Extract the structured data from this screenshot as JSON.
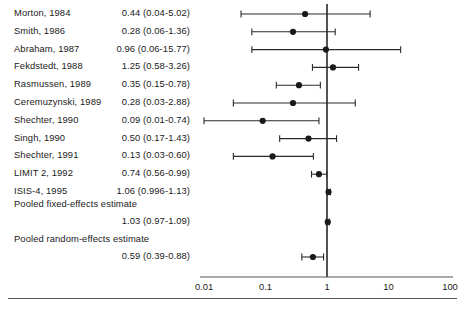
{
  "chart_data": {
    "type": "forest",
    "title": "",
    "xlabel": "",
    "ylabel": "",
    "xscale": "log",
    "xlim": [
      0.01,
      100
    ],
    "xticks": [
      0.01,
      0.1,
      1,
      10,
      100
    ],
    "xtick_labels": [
      "0.01",
      "0.1",
      "1",
      "10",
      "100"
    ],
    "null_line": 1,
    "grid": false,
    "legend": "none",
    "studies": [
      {
        "label": "Morton, 1984",
        "estimate_text": "0.44 (0.04-5.02)",
        "est": 0.44,
        "low": 0.04,
        "high": 5.02
      },
      {
        "label": "Smith, 1986",
        "estimate_text": "0.28 (0.06-1.36)",
        "est": 0.28,
        "low": 0.06,
        "high": 1.36
      },
      {
        "label": "Abraham, 1987",
        "estimate_text": "0.96 (0.06-15.77)",
        "est": 0.96,
        "low": 0.06,
        "high": 15.77
      },
      {
        "label": "Fekdstedt, 1988",
        "estimate_text": "1.25 (0.58-3.26)",
        "est": 1.25,
        "low": 0.58,
        "high": 3.26
      },
      {
        "label": "Rasmussen, 1989",
        "estimate_text": "0.35 (0.15-0.78)",
        "est": 0.35,
        "low": 0.15,
        "high": 0.78
      },
      {
        "label": "Ceremuzynski, 1989",
        "estimate_text": "0.28 (0.03-2.88)",
        "est": 0.28,
        "low": 0.03,
        "high": 2.88
      },
      {
        "label": "Shechter, 1990",
        "estimate_text": "0.09 (0.01-0.74)",
        "est": 0.09,
        "low": 0.01,
        "high": 0.74
      },
      {
        "label": "Singh, 1990",
        "estimate_text": "0.50 (0.17-1.43)",
        "est": 0.5,
        "low": 0.17,
        "high": 1.43
      },
      {
        "label": "Shechter, 1991",
        "estimate_text": "0.13 (0.03-0.60)",
        "est": 0.13,
        "low": 0.03,
        "high": 0.6
      },
      {
        "label": "LIMIT 2, 1992",
        "estimate_text": "0.74 (0.56-0.99)",
        "est": 0.74,
        "low": 0.56,
        "high": 0.99
      },
      {
        "label": "ISIS-4, 1995",
        "estimate_text": "1.06 (0.996-1.13)",
        "est": 1.06,
        "low": 0.996,
        "high": 1.13
      }
    ],
    "pooled": [
      {
        "title": "Pooled fixed-effects estimate",
        "estimate_text": "1.03 (0.97-1.09)",
        "est": 1.03,
        "low": 0.97,
        "high": 1.09
      },
      {
        "title": "Pooled random-effects estimate",
        "estimate_text": "0.59 (0.39-0.88)",
        "est": 0.59,
        "low": 0.39,
        "high": 0.88
      }
    ]
  },
  "colors": {
    "marker": "#1a1a1a",
    "line": "#2b2b2b",
    "null_line": "#1a1a1a",
    "axis": "#555555",
    "text": "#1a1a1a"
  }
}
